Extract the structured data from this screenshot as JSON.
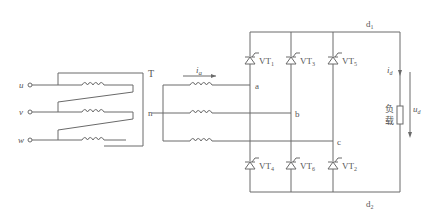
{
  "diagram": {
    "type": "three-phase fully-controlled bridge rectifier circuit",
    "inputs": [
      {
        "label": "u",
        "y": 85
      },
      {
        "label": "v",
        "y": 112
      },
      {
        "label": "w",
        "y": 140
      }
    ],
    "transformer_label": "T",
    "neutral_label": "n",
    "current_a_label": "i",
    "current_a_sub": "a",
    "nodes": {
      "a": "a",
      "b": "b",
      "c": "c"
    },
    "thyristors_top": [
      {
        "label": "VT",
        "sub": "1",
        "x": 250
      },
      {
        "label": "VT",
        "sub": "3",
        "x": 291
      },
      {
        "label": "VT",
        "sub": "5",
        "x": 333
      }
    ],
    "thyristors_bottom": [
      {
        "label": "VT",
        "sub": "4",
        "x": 250
      },
      {
        "label": "VT",
        "sub": "6",
        "x": 291
      },
      {
        "label": "VT",
        "sub": "2",
        "x": 333
      }
    ],
    "rail_top": {
      "label": "d",
      "sub": "1"
    },
    "rail_bottom": {
      "label": "d",
      "sub": "2"
    },
    "load": {
      "label_line1": "负",
      "label_line2": "载"
    },
    "load_current": {
      "label": "i",
      "sub": "d"
    },
    "load_voltage": {
      "label": "u",
      "sub": "d"
    },
    "colors": {
      "line": "#6a6a6a",
      "text": "#555555"
    }
  }
}
